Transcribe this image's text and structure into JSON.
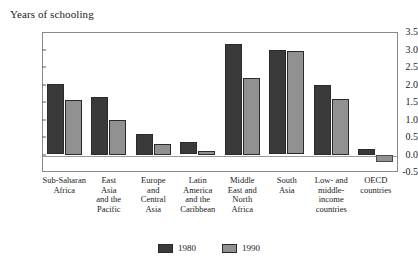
{
  "chart_data": {
    "type": "bar",
    "title": "",
    "ylabel": "Years of schooling",
    "xlabel": "",
    "ylim": [
      -0.5,
      3.5
    ],
    "ytick_labels": [
      "3.5",
      "3.0",
      "2.5",
      "2.0",
      "1.5",
      "1.0",
      "0.5",
      "0.0",
      "-0.5"
    ],
    "ytick_values": [
      3.5,
      3.0,
      2.5,
      2.0,
      1.5,
      1.0,
      0.5,
      0.0,
      -0.5
    ],
    "grid": false,
    "legend_position": "bottom-center",
    "categories": [
      "Sub-Saharan Africa",
      "East Asia and the Pacific",
      "Europe and Central Asia",
      "Latin America and the Caribbean",
      "Middle East and North Africa",
      "South Asia",
      "Low- and middle-income countries",
      "OECD countries"
    ],
    "category_label_lines": [
      [
        "Sub-Saharan",
        "Africa"
      ],
      [
        "East",
        "Asia",
        "and the",
        "Pacific"
      ],
      [
        "Europe",
        "and",
        "Central",
        "Asia"
      ],
      [
        "Latin",
        "America",
        "and the",
        "Caribbean"
      ],
      [
        "Middle",
        "East and",
        "North",
        "Africa"
      ],
      [
        "South",
        "Asia"
      ],
      [
        "Low- and",
        "middle-",
        "income",
        "countries"
      ],
      [
        "OECD",
        "countries"
      ]
    ],
    "series": [
      {
        "name": "1980",
        "color": "#3a3a3a",
        "values": [
          2.02,
          1.65,
          0.6,
          0.37,
          3.15,
          2.98,
          2.0,
          0.15
        ]
      },
      {
        "name": "1990",
        "color": "#919191",
        "values": [
          1.55,
          1.0,
          0.3,
          0.1,
          2.2,
          2.97,
          1.6,
          -0.2
        ]
      }
    ]
  },
  "legend": {
    "items": [
      {
        "label": "1980",
        "color": "#3a3a3a"
      },
      {
        "label": "1990",
        "color": "#919191"
      }
    ]
  }
}
